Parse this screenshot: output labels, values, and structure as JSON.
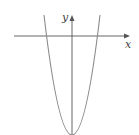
{
  "diagram": {
    "type": "function-graph",
    "curve": "parabola opening upward, vertex below x-axis on y-axis",
    "axes": {
      "x_label": "x",
      "y_label": "y"
    },
    "colors": {
      "axis": "#555555",
      "curve": "#8a8a8a",
      "background": "#ffffff"
    }
  }
}
